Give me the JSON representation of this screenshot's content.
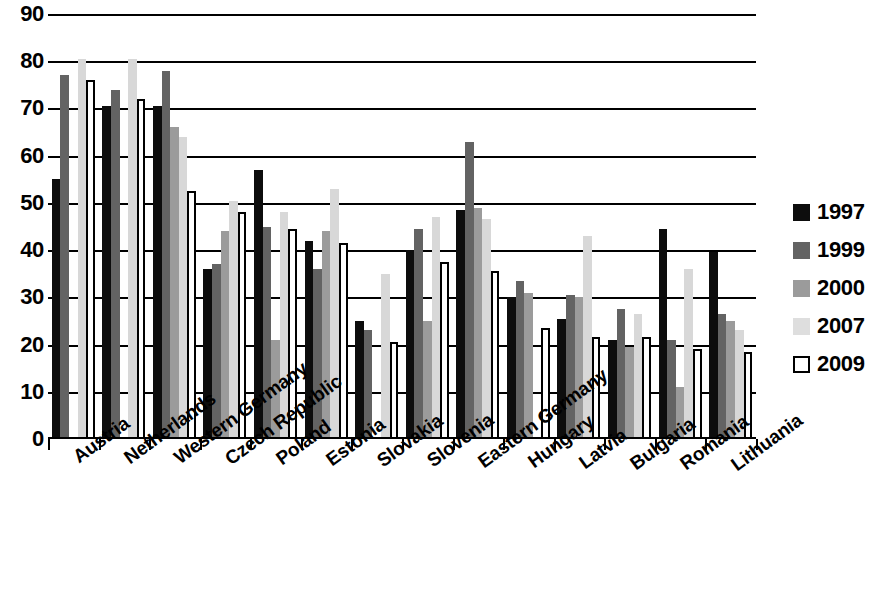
{
  "chart_data": {
    "type": "bar",
    "title": "",
    "subtitle": "",
    "xlabel": "",
    "ylabel": "",
    "ylim": [
      0,
      90
    ],
    "yticks": [
      0,
      10,
      20,
      30,
      40,
      50,
      60,
      70,
      80,
      90
    ],
    "ytick_labels": [
      "0",
      "10",
      "20",
      "30",
      "40",
      "50",
      "60",
      "70",
      "80",
      "90"
    ],
    "grid": true,
    "grid_axis": "y",
    "legend_position": "right",
    "categories": [
      "Austria",
      "Netherlands",
      "Western Germany",
      "Czech Republic",
      "Poland",
      "Estonia",
      "Slovakia",
      "Slovenia",
      "Eastern Germany",
      "Hungary",
      "Latvia",
      "Bulgaria",
      "Romania",
      "Lithuania"
    ],
    "series": [
      {
        "name": "1997",
        "color": "#0d0d0d",
        "values": [
          55,
          70.5,
          70.5,
          36,
          57,
          42,
          25,
          40,
          48.5,
          30,
          25.5,
          21,
          44.5,
          39.5
        ]
      },
      {
        "name": "1999",
        "color": "#636363",
        "values": [
          77,
          74,
          78,
          37,
          45,
          36,
          23,
          44.5,
          63,
          33.5,
          30.5,
          27.5,
          21,
          26.5
        ]
      },
      {
        "name": "2000",
        "color": "#9b9b9b",
        "values": [
          null,
          null,
          66,
          44,
          21,
          44,
          null,
          25,
          49,
          31,
          30,
          19.5,
          11,
          25
        ]
      },
      {
        "name": "2007",
        "color": "#d8d8d8",
        "values": [
          80.5,
          80.5,
          64,
          50.5,
          48,
          53,
          35,
          47,
          46.5,
          null,
          43,
          26.5,
          36,
          23
        ]
      },
      {
        "name": "2009",
        "color": "#ffffff",
        "values": [
          76,
          72,
          52.5,
          48,
          44.5,
          41.5,
          20.5,
          37.5,
          35.5,
          23.5,
          21.5,
          21.5,
          19,
          18.5
        ]
      }
    ]
  },
  "legend": {
    "entries": [
      {
        "label": "1997"
      },
      {
        "label": "1999"
      },
      {
        "label": "2000"
      },
      {
        "label": "2007"
      },
      {
        "label": "2009"
      }
    ]
  }
}
